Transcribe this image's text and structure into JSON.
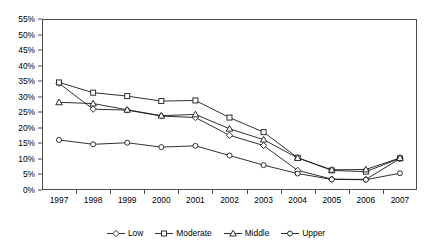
{
  "title_strip": "",
  "chart_data": {
    "type": "line",
    "title": "",
    "subtitle": "",
    "xlabel": "",
    "ylabel": "",
    "x": [
      "1997",
      "1998",
      "1999",
      "2000",
      "2001",
      "2002",
      "2003",
      "2004",
      "2005",
      "2006",
      "2007"
    ],
    "categories": [
      "1997",
      "1998",
      "1999",
      "2000",
      "2001",
      "2002",
      "2003",
      "2004",
      "2005",
      "2006",
      "2007"
    ],
    "ylim": [
      0,
      55
    ],
    "y_ticks": [
      "0%",
      "5%",
      "10%",
      "15%",
      "20%",
      "25%",
      "30%",
      "35%",
      "40%",
      "45%",
      "50%",
      "55%"
    ],
    "y_tick_values": [
      0,
      5,
      10,
      15,
      20,
      25,
      30,
      35,
      40,
      45,
      50,
      55
    ],
    "grid": false,
    "legend_position": "bottom",
    "series": [
      {
        "name": "Low",
        "marker": "diamond",
        "color": "#1a1a1a",
        "values": [
          34.3,
          26.0,
          25.7,
          23.8,
          23.3,
          17.6,
          14.3,
          6.3,
          3.5,
          3.4,
          10.1
        ]
      },
      {
        "name": "Moderate",
        "marker": "square",
        "color": "#1a1a1a",
        "values": [
          34.6,
          31.3,
          30.2,
          28.6,
          28.8,
          23.3,
          18.6,
          10.4,
          6.3,
          5.9,
          10.2
        ]
      },
      {
        "name": "Middle",
        "marker": "triangle",
        "color": "#1a1a1a",
        "values": [
          28.2,
          27.8,
          25.8,
          23.9,
          24.3,
          19.7,
          16.2,
          10.3,
          6.5,
          6.6,
          10.3
        ]
      },
      {
        "name": "Upper",
        "marker": "circle",
        "color": "#1a1a1a",
        "values": [
          16.1,
          14.7,
          15.2,
          13.8,
          14.2,
          11.1,
          8.0,
          5.3,
          3.4,
          3.3,
          5.4
        ]
      }
    ]
  },
  "legend": {
    "items": [
      {
        "label": "Low",
        "marker": "diamond"
      },
      {
        "label": "Moderate",
        "marker": "square"
      },
      {
        "label": "Middle",
        "marker": "triangle"
      },
      {
        "label": "Upper",
        "marker": "circle"
      }
    ]
  }
}
